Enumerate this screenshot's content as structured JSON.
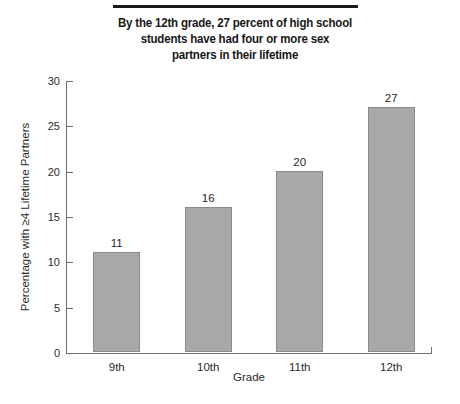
{
  "chart_data": {
    "type": "bar",
    "title": "By the 12th grade, 27 percent of high school students have had four or more sex partners in their lifetime",
    "title_lines": [
      "By the 12th grade, 27 percent of high school",
      "students have had four or more sex",
      "partners in their lifetime"
    ],
    "categories": [
      "9th",
      "10th",
      "11th",
      "12th"
    ],
    "values": [
      11,
      16,
      20,
      27
    ],
    "value_labels": [
      "11",
      "16",
      "20",
      "27"
    ],
    "xlabel": "Grade",
    "ylabel": "Percentage with ≥4 Lifetime Partners",
    "ylim": [
      0,
      30
    ],
    "yticks": [
      0,
      5,
      10,
      15,
      20,
      25,
      30
    ],
    "ytick_labels": [
      "0",
      "5",
      "10",
      "15",
      "20",
      "25",
      "30"
    ],
    "grid": false,
    "legend": null,
    "colors": {
      "bar_fill": "#a8a8a8",
      "bar_border": "#8a8a8a",
      "axis": "#6e6e6e",
      "text": "#1a1a1a",
      "title_rule": "#1a1a1a",
      "background": "#ffffff"
    }
  }
}
